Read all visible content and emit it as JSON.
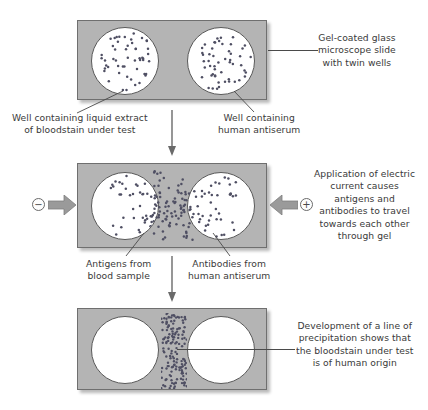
{
  "figure": {
    "background_color": "#ffffff",
    "slide_color": "#b4b4b4",
    "well_color": "#ffffff",
    "dot_color": "#4f4f63",
    "text_color": "#3a3a3a"
  },
  "panels": [
    {
      "id": "panel-1",
      "step": 1,
      "slide": {
        "x": 77,
        "y": 20,
        "w": 190,
        "h": 80
      },
      "wells": [
        {
          "name": "left-well",
          "cx": 124,
          "cy": 60,
          "r": 34,
          "fill": "white",
          "dots": "scattered-uniform"
        },
        {
          "name": "right-well",
          "cx": 220,
          "cy": 60,
          "r": 34,
          "fill": "white",
          "dots": "scattered-uniform"
        }
      ],
      "callouts": [
        {
          "name": "slide-callout",
          "text_lines": [
            "Gel-coated glass",
            "microscope slide",
            "with twin wells"
          ],
          "align": "center",
          "x": 318,
          "y": 32
        },
        {
          "name": "left-well-callout",
          "text_lines": [
            "Well containing liquid extract",
            "of bloodstain under test"
          ],
          "align": "center",
          "x": 12,
          "y": 112
        },
        {
          "name": "right-well-callout",
          "text_lines": [
            "Well containing",
            "human antiserum"
          ],
          "align": "center",
          "x": 218,
          "y": 112
        }
      ]
    },
    {
      "id": "panel-2",
      "step": 2,
      "slide": {
        "x": 77,
        "y": 163,
        "w": 190,
        "h": 85
      },
      "wells": [
        {
          "name": "left-well",
          "cx": 124,
          "cy": 205,
          "r": 34,
          "fill": "white",
          "dots": "clustered-right-edge"
        },
        {
          "name": "right-well",
          "cx": 220,
          "cy": 205,
          "r": 34,
          "fill": "white",
          "dots": "clustered-left-edge"
        }
      ],
      "electrodes": [
        {
          "name": "negative-electrode",
          "symbol": "−",
          "label": "negative",
          "side": "left",
          "arrow": "right"
        },
        {
          "name": "positive-electrode",
          "symbol": "+",
          "label": "positive",
          "side": "right",
          "arrow": "left"
        }
      ],
      "callouts": [
        {
          "name": "electric-current-callout",
          "text_lines": [
            "Application of electric",
            "current causes",
            "antigens and",
            "antibodies to travel",
            "towards each other",
            "through gel"
          ],
          "align": "center",
          "x": 314,
          "y": 168
        },
        {
          "name": "antigens-callout",
          "text_lines": [
            "Antigens from",
            "blood sample"
          ],
          "align": "center",
          "x": 86,
          "y": 258
        },
        {
          "name": "antibodies-callout",
          "text_lines": [
            "Antibodies from",
            "human antiserum"
          ],
          "align": "center",
          "x": 188,
          "y": 258
        }
      ]
    },
    {
      "id": "panel-3",
      "step": 3,
      "slide": {
        "x": 77,
        "y": 308,
        "w": 190,
        "h": 82
      },
      "wells": [
        {
          "name": "left-well",
          "cx": 124,
          "cy": 349,
          "r": 34,
          "fill": "white",
          "dots": "none"
        },
        {
          "name": "right-well",
          "cx": 220,
          "cy": 349,
          "r": 34,
          "fill": "white",
          "dots": "none"
        }
      ],
      "precipitation_band": {
        "name": "precipitation-line",
        "x": 160,
        "y": 312,
        "w": 26,
        "h": 76,
        "description": "dense vertical band of precipitate dots between the two wells"
      },
      "callouts": [
        {
          "name": "precipitation-callout",
          "text_lines": [
            "Development of a line of",
            "precipitation shows that",
            "the bloodstain under test",
            "is of human origin"
          ],
          "align": "center",
          "x": 296,
          "y": 320
        }
      ]
    }
  ],
  "flow_arrows": [
    {
      "name": "flow-arrow-1-to-2",
      "from_panel": "panel-1",
      "to_panel": "panel-2",
      "direction": "down",
      "x": 172,
      "y1": 110,
      "y2": 156
    },
    {
      "name": "flow-arrow-2-to-3",
      "from_panel": "panel-2",
      "to_panel": "panel-3",
      "direction": "down",
      "x": 172,
      "y1": 256,
      "y2": 302
    }
  ]
}
